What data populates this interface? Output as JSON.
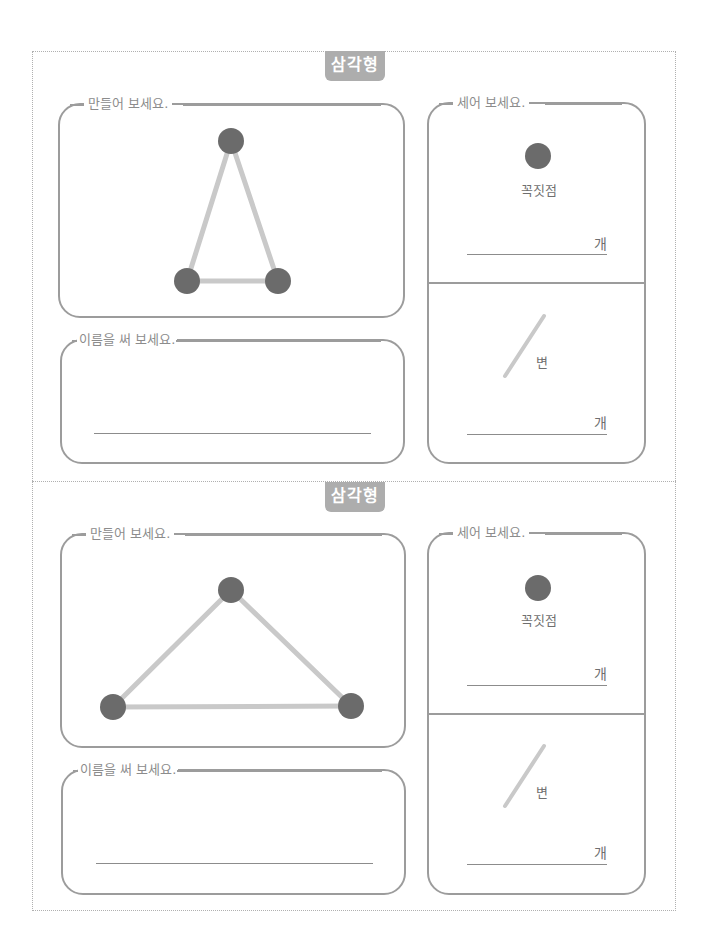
{
  "sheets": [
    {
      "badge": "삼각형",
      "make_card": {
        "legend": "만들어 보세요."
      },
      "name_card": {
        "legend": "이름을 써 보세요."
      },
      "count_card": {
        "legend": "세어 보세요.",
        "vertex_label": "꼭짓점",
        "vertex_unit": "개",
        "side_label": "변",
        "side_unit": "개"
      },
      "triangle": {
        "vertices": [
          [
            231,
            141
          ],
          [
            187,
            281
          ],
          [
            278,
            281
          ]
        ]
      }
    },
    {
      "badge": "삼각형",
      "make_card": {
        "legend": "만들어 보세요."
      },
      "name_card": {
        "legend": "이름을 써 보세요."
      },
      "count_card": {
        "legend": "세어 보세요.",
        "vertex_label": "꼭짓점",
        "vertex_unit": "개",
        "side_label": "변",
        "side_unit": "개"
      },
      "triangle": {
        "vertices": [
          [
            231,
            590
          ],
          [
            113,
            707
          ],
          [
            351,
            706
          ]
        ]
      }
    }
  ],
  "colors": {
    "border": "#9c9c9c",
    "badge": "#adadad",
    "vertex": "#6b6b6b",
    "edge": "#c9c9c9"
  }
}
